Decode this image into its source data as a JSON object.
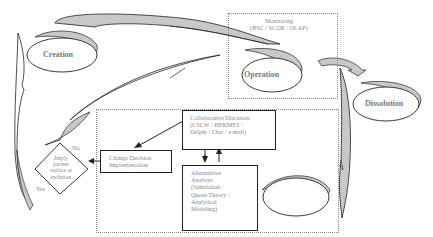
{
  "diagram": {
    "phases": {
      "creation": "Creation",
      "operation": "Operation",
      "dissolution": "Dissolution"
    },
    "monitoring": {
      "title": "Monitoring",
      "tools": "(BSC / SCOR / OLAP)"
    },
    "collaborative": {
      "line1": "Collaborative Discution",
      "line2": "(CSCW / HERMES /",
      "line3": "Delphi / Chat / e-mail)"
    },
    "alternatives": {
      "line1": "Alternatives",
      "line2": "Analisys",
      "line3": "(Simulation /",
      "line4": "Queue Theory /",
      "line5": "Analytical",
      "line6": "Modeling)"
    },
    "change_decision": {
      "line1": "Change Decision",
      "line2": "Implementation"
    },
    "decision_diamond": {
      "line1": "Imply",
      "line2": "partner",
      "line3": "replace or",
      "line4": "inclusion",
      "yes": "Yes",
      "no": "No"
    },
    "colors": {
      "stroke": "#222222",
      "shade": "#c8c8c8",
      "text": "#8a8a8a",
      "dotted": "#888888"
    }
  }
}
